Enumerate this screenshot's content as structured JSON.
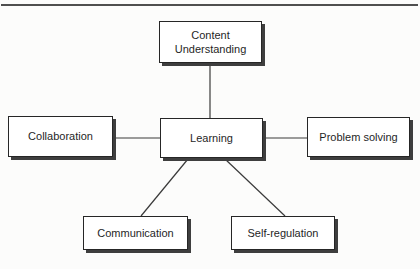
{
  "diagram": {
    "nodes": {
      "content_understanding": {
        "label": "Content Understanding"
      },
      "collaboration": {
        "label": "Collaboration"
      },
      "learning": {
        "label": "Learning"
      },
      "problem_solving": {
        "label": "Problem solving"
      },
      "communication": {
        "label": "Communication"
      },
      "self_regulation": {
        "label": "Self-regulation"
      }
    },
    "edges": [
      {
        "from": "content_understanding",
        "to": "learning"
      },
      {
        "from": "collaboration",
        "to": "learning"
      },
      {
        "from": "learning",
        "to": "problem_solving"
      },
      {
        "from": "learning",
        "to": "communication"
      },
      {
        "from": "learning",
        "to": "self_regulation"
      }
    ],
    "colors": {
      "background": "#fcfcfb",
      "box_fill": "#ffffff",
      "box_border": "#262626",
      "box_shadow": "#3e3e3e",
      "connector_line": "#3a3a3a",
      "top_rule": "#4f4f4f",
      "text": "#1f1f1f"
    }
  }
}
